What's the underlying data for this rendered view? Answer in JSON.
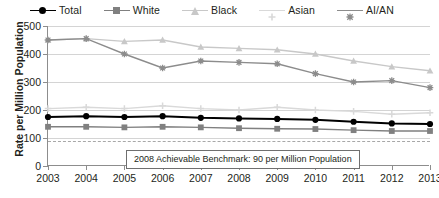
{
  "chart": {
    "type": "line",
    "title": "",
    "ylabel": "Rate per Million Population",
    "xlabel": ""
  },
  "legend": {
    "position": "top",
    "items": [
      {
        "label": "Total",
        "color": "#000000",
        "marker": "circle",
        "marker_name": "legend-marker-circle"
      },
      {
        "label": "White",
        "color": "#808080",
        "marker": "square",
        "marker_name": "legend-marker-square"
      },
      {
        "label": "Black",
        "color": "#c8c8c8",
        "marker": "triangle",
        "marker_name": "legend-marker-triangle"
      },
      {
        "label": "Asian",
        "color": "#d9d9d9",
        "marker": "plus",
        "marker_name": "legend-marker-plus"
      },
      {
        "label": "AI/AN",
        "color": "#8c8c8c",
        "marker": "cross",
        "marker_name": "legend-marker-cross"
      }
    ]
  },
  "yaxis": {
    "ticks": [
      "500",
      "400",
      "300",
      "200",
      "100",
      "0"
    ],
    "min": 0,
    "max": 500,
    "step": 100
  },
  "annotation": {
    "benchmark_value": 90,
    "text": "2008 Achievable Benchmark: 90 per Million Population"
  },
  "chart_data": {
    "type": "line",
    "title": "",
    "xlabel": "",
    "ylabel": "Rate per Million Population",
    "ylim": [
      0,
      500
    ],
    "ytick_step": 100,
    "grid": true,
    "legend_position": "top",
    "categories": [
      "2003",
      "2004",
      "2005",
      "2006",
      "2007",
      "2008",
      "2009",
      "2010",
      "2011",
      "2012",
      "2013"
    ],
    "series": [
      {
        "name": "Total",
        "color": "#000000",
        "marker": "circle",
        "values": [
          175,
          178,
          175,
          178,
          172,
          170,
          168,
          165,
          158,
          152,
          150
        ]
      },
      {
        "name": "White",
        "color": "#808080",
        "marker": "square",
        "values": [
          140,
          140,
          138,
          140,
          138,
          135,
          133,
          132,
          128,
          125,
          125
        ]
      },
      {
        "name": "Black",
        "color": "#c8c8c8",
        "marker": "triangle",
        "values": [
          450,
          455,
          445,
          450,
          425,
          420,
          415,
          400,
          375,
          355,
          340
        ]
      },
      {
        "name": "Asian",
        "color": "#d9d9d9",
        "marker": "plus",
        "values": [
          205,
          210,
          205,
          215,
          205,
          200,
          210,
          200,
          195,
          185,
          190
        ]
      },
      {
        "name": "AI/AN",
        "color": "#8c8c8c",
        "marker": "cross",
        "values": [
          450,
          455,
          400,
          350,
          375,
          370,
          365,
          330,
          300,
          305,
          280
        ]
      }
    ],
    "reference_line": {
      "value": 90,
      "style": "dashed",
      "label": "2008 Achievable Benchmark: 90 per Million Population"
    }
  }
}
